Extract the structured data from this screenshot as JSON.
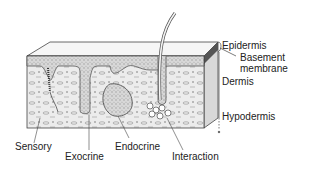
{
  "figure": {
    "colors": {
      "line": "#333333",
      "fill": "#e8e8e8",
      "epidermis_fill": "#f3f3f3",
      "text": "#222222"
    }
  },
  "layer_labels": {
    "epidermis": "Epidermis",
    "basement_membrane_line1": "Basement",
    "basement_membrane_line2": "membrane",
    "dermis": "Dermis",
    "hypodermis": "Hypodermis"
  },
  "structure_labels": {
    "sensory": "Sensory",
    "exocrine": "Exocrine",
    "endocrine": "Endocrine",
    "interaction": "Interaction"
  }
}
